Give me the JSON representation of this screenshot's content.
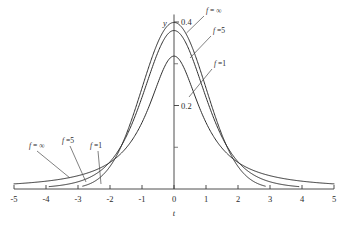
{
  "chart_data": {
    "type": "line",
    "title": "",
    "xlabel": "t",
    "ylabel": "y",
    "xlim": [
      -5,
      5
    ],
    "ylim": [
      0,
      0.42
    ],
    "grid": false,
    "legend_position": "inline-annotations",
    "x_ticks": [
      "-5",
      "-4",
      "-3",
      "-2",
      "-1",
      "0",
      "1",
      "2",
      "3",
      "4",
      "5"
    ],
    "x_tick_values": [
      -5,
      -4,
      -3,
      -2,
      -1,
      0,
      1,
      2,
      3,
      4,
      5
    ],
    "y_ticks": [
      "0.2",
      "0.4"
    ],
    "y_tick_values": [
      0.2,
      0.4
    ],
    "y_minor_tick_values": [
      0.1,
      0.3
    ],
    "series": [
      {
        "name": "f = 1",
        "label_symbol": "f",
        "label_value": "1",
        "df": 1,
        "peak": 0.3183,
        "x_range": [
          -5,
          5
        ],
        "points_x": [
          -5,
          -4,
          -3,
          -2.5,
          -2,
          -1.5,
          -1,
          -0.5,
          0,
          0.5,
          1,
          1.5,
          2,
          2.5,
          3,
          4,
          5
        ],
        "points_y": [
          0.0122,
          0.0187,
          0.0318,
          0.0439,
          0.0637,
          0.0979,
          0.1592,
          0.2546,
          0.3183,
          0.2546,
          0.1592,
          0.0979,
          0.0637,
          0.0439,
          0.0318,
          0.0187,
          0.0122
        ]
      },
      {
        "name": "f = 5",
        "label_symbol": "f",
        "label_value": "5",
        "df": 5,
        "peak": 0.3796,
        "x_range": [
          -3.9,
          3.9
        ],
        "points_x": [
          -3.9,
          -3,
          -2.5,
          -2,
          -1.5,
          -1,
          -0.5,
          0,
          0.5,
          1,
          1.5,
          2,
          2.5,
          3,
          3.9
        ],
        "points_y": [
          0.0059,
          0.0173,
          0.0269,
          0.0651,
          0.1245,
          0.2196,
          0.3279,
          0.3796,
          0.3279,
          0.2196,
          0.1245,
          0.0651,
          0.0269,
          0.0173,
          0.0059
        ]
      },
      {
        "name": "f = ∞",
        "label_symbol": "f",
        "label_value": "∞",
        "df": "infinity",
        "peak": 0.3989,
        "x_range": [
          -2.85,
          2.85
        ],
        "points_x": [
          -2.85,
          -2.5,
          -2,
          -1.5,
          -1,
          -0.5,
          0,
          0.5,
          1,
          1.5,
          2,
          2.5,
          2.85
        ],
        "points_y": [
          0.0069,
          0.0175,
          0.054,
          0.1295,
          0.242,
          0.3521,
          0.3989,
          0.3521,
          0.242,
          0.1295,
          0.054,
          0.0175,
          0.0069
        ]
      }
    ],
    "annotations_right": [
      {
        "text_symbol": "f",
        "text_value": "= ∞"
      },
      {
        "text_symbol": "f",
        "text_value": "=5"
      },
      {
        "text_symbol": "f",
        "text_value": "=1"
      }
    ],
    "annotations_left": [
      {
        "text_symbol": "f",
        "text_value": "= ∞"
      },
      {
        "text_symbol": "f",
        "text_value": "=5"
      },
      {
        "text_symbol": "f",
        "text_value": "=1"
      }
    ],
    "colors": {
      "curve": "#2f2f2f",
      "axis": "#3a3a3a",
      "text": "#2b2b2b",
      "background": "#ffffff"
    }
  }
}
